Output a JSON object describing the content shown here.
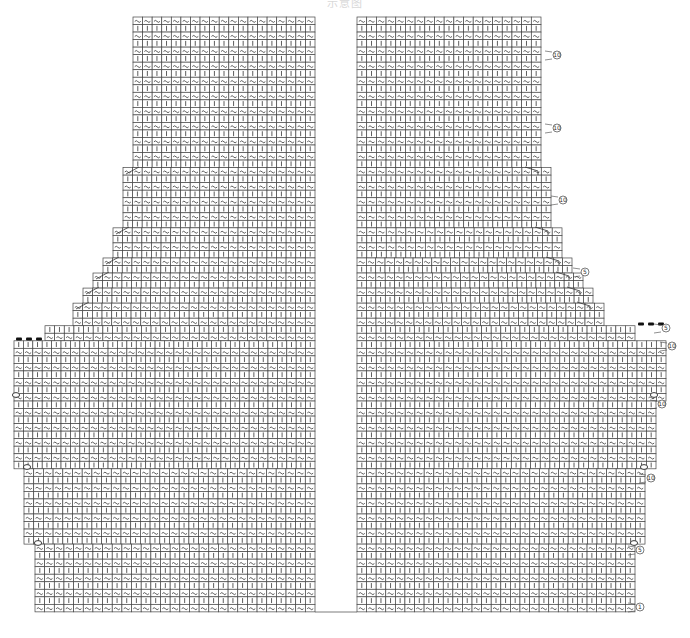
{
  "title": "示意图",
  "chart": {
    "top_y": 17,
    "row_height": 7.53,
    "cell_width": 9.55,
    "row_count": 79,
    "row_symbols": [
      "~",
      "|"
    ],
    "left_panel": {
      "right_x": 315,
      "edges": [
        {
          "from_y": 17,
          "to_y": 163,
          "left_x": 133
        },
        {
          "from_y": 163,
          "to_y": 223,
          "left_x": 123
        },
        {
          "from_y": 223,
          "to_y": 253,
          "left_x": 113
        },
        {
          "from_y": 253,
          "to_y": 268,
          "left_x": 103
        },
        {
          "from_y": 268,
          "to_y": 283,
          "left_x": 93
        },
        {
          "from_y": 283,
          "to_y": 298,
          "left_x": 83
        },
        {
          "from_y": 298,
          "to_y": 320,
          "left_x": 73
        },
        {
          "from_y": 320,
          "to_y": 335,
          "left_x": 45
        },
        {
          "from_y": 335,
          "to_y": 467,
          "left_x": 14
        },
        {
          "from_y": 467,
          "to_y": 543,
          "left_x": 24
        },
        {
          "from_y": 543,
          "to_y": 612,
          "left_x": 35
        }
      ],
      "decrease_marks": [
        {
          "x": 123,
          "y": 170
        },
        {
          "x": 113,
          "y": 230
        },
        {
          "x": 103,
          "y": 260
        },
        {
          "x": 93,
          "y": 275
        },
        {
          "x": 83,
          "y": 290
        },
        {
          "x": 73,
          "y": 305
        }
      ],
      "bind_off_dots": [
        {
          "x": 19,
          "y": 339
        },
        {
          "x": 29,
          "y": 339
        },
        {
          "x": 39,
          "y": 339
        }
      ],
      "loop_marks": [
        {
          "x": 16,
          "y": 395
        },
        {
          "x": 27,
          "y": 467
        },
        {
          "x": 38,
          "y": 543
        }
      ]
    },
    "right_panel": {
      "left_x": 357,
      "edges": [
        {
          "from_y": 17,
          "to_y": 163,
          "right_x": 541
        },
        {
          "from_y": 163,
          "to_y": 223,
          "right_x": 551
        },
        {
          "from_y": 223,
          "to_y": 253,
          "right_x": 562
        },
        {
          "from_y": 253,
          "to_y": 268,
          "right_x": 572
        },
        {
          "from_y": 268,
          "to_y": 283,
          "right_x": 583
        },
        {
          "from_y": 283,
          "to_y": 298,
          "right_x": 593
        },
        {
          "from_y": 298,
          "to_y": 320,
          "right_x": 604
        },
        {
          "from_y": 320,
          "to_y": 335,
          "right_x": 635
        },
        {
          "from_y": 335,
          "to_y": 395,
          "right_x": 666
        },
        {
          "from_y": 395,
          "to_y": 467,
          "right_x": 656
        },
        {
          "from_y": 467,
          "to_y": 543,
          "right_x": 645
        },
        {
          "from_y": 543,
          "to_y": 612,
          "right_x": 635
        }
      ],
      "decrease_marks": [
        {
          "x": 541,
          "y": 170
        },
        {
          "x": 551,
          "y": 230
        },
        {
          "x": 562,
          "y": 260
        },
        {
          "x": 572,
          "y": 275
        },
        {
          "x": 583,
          "y": 290
        },
        {
          "x": 593,
          "y": 305
        }
      ],
      "bind_off_dots": [
        {
          "x": 641,
          "y": 324
        },
        {
          "x": 651,
          "y": 324
        },
        {
          "x": 661,
          "y": 324
        }
      ],
      "loop_marks": [
        {
          "x": 654,
          "y": 395
        },
        {
          "x": 644,
          "y": 467
        },
        {
          "x": 634,
          "y": 543
        }
      ]
    },
    "row_markers": [
      {
        "label": "10",
        "x": 557,
        "y": 55
      },
      {
        "label": "10",
        "x": 557,
        "y": 128
      },
      {
        "label": "10",
        "x": 563,
        "y": 200
      },
      {
        "label": "5",
        "x": 585,
        "y": 272
      },
      {
        "label": "5",
        "x": 666,
        "y": 328
      },
      {
        "label": "10",
        "x": 672,
        "y": 346
      },
      {
        "label": "10",
        "x": 662,
        "y": 404
      },
      {
        "label": "10",
        "x": 651,
        "y": 478
      },
      {
        "label": "5",
        "x": 640,
        "y": 550
      },
      {
        "label": "1",
        "x": 640,
        "y": 607
      }
    ]
  }
}
